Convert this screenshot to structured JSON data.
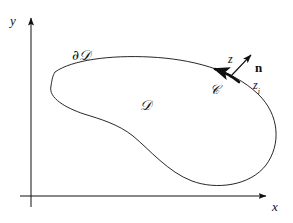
{
  "figure": {
    "background_color": "#ffffff",
    "stroke_color": "#101010",
    "width": 293,
    "height": 223
  },
  "axes": {
    "x_label": "x",
    "y_label": "y",
    "origin": {
      "x": 31,
      "y": 196
    },
    "x_axis": {
      "x1": 20,
      "y1": 196,
      "x2": 268,
      "y2": 196,
      "arrow": "right"
    },
    "y_axis": {
      "x1": 31,
      "y1": 207,
      "x2": 31,
      "y2": 16,
      "arrow": "up"
    }
  },
  "labels": {
    "boundary": "∂𝒟",
    "region": "𝒟",
    "curve": "𝒞",
    "point_z": "z",
    "point_zi_base": "z",
    "point_zi_sub": "i",
    "normal": "n"
  },
  "shapes": {
    "blob_path": "M 55 72 C 80 58, 140 56, 185 62 C 222 67, 258 85, 272 118 C 283 144, 275 170, 247 181 C 222 191, 196 187, 180 177 C 160 164, 140 143, 122 129 C 108 118, 92 113, 76 108 C 60 103, 48 92, 52 83 C 53 77, 54 74, 55 72 Z",
    "curve_arc_path": "M 238 81 C 231 77, 222 73, 213 70",
    "normal_arrow": {
      "x1": 230,
      "y1": 77,
      "x2": 252,
      "y2": 54
    },
    "arc_arrow_direction": "counterclockwise"
  },
  "annotations": {
    "arc_highlight_width": 2.6,
    "outline_width": 0.9,
    "axis_width": 1.0
  }
}
